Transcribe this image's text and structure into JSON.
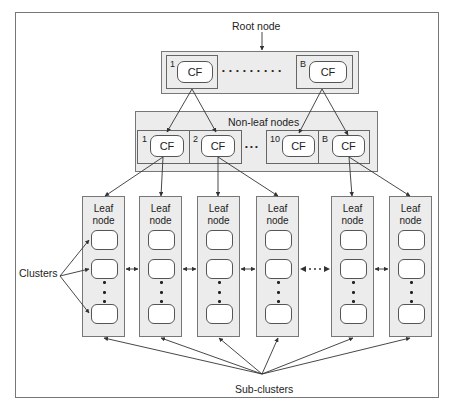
{
  "labels": {
    "root_node": "Root node",
    "non_leaf_nodes": "Non-leaf nodes",
    "clusters": "Clusters",
    "sub_clusters": "Sub-clusters"
  },
  "root": {
    "entries": [
      {
        "index": "1",
        "label": "CF"
      },
      {
        "index": "B",
        "label": "CF"
      }
    ],
    "ellipsis": "• • • • • • • • •"
  },
  "non_leaf": {
    "entries": [
      {
        "index": "1",
        "label": "CF"
      },
      {
        "index": "2",
        "label": "CF"
      },
      {
        "index": "10",
        "label": "CF"
      },
      {
        "index": "B",
        "label": "CF"
      }
    ],
    "ellipsis": "• • •"
  },
  "leaf_nodes": [
    {
      "title_line1": "Leaf",
      "title_line2": "node"
    },
    {
      "title_line1": "Leaf",
      "title_line2": "node"
    },
    {
      "title_line1": "Leaf",
      "title_line2": "node"
    },
    {
      "title_line1": "Leaf",
      "title_line2": "node"
    },
    {
      "title_line1": "Leaf",
      "title_line2": "node"
    },
    {
      "title_line1": "Leaf",
      "title_line2": "node"
    }
  ],
  "leaf_link_ellipsis": "• • •",
  "colors": {
    "node_fill": "#ececec",
    "entry_fill": "#ffffff",
    "stroke": "#555555",
    "arrow": "#333333"
  }
}
